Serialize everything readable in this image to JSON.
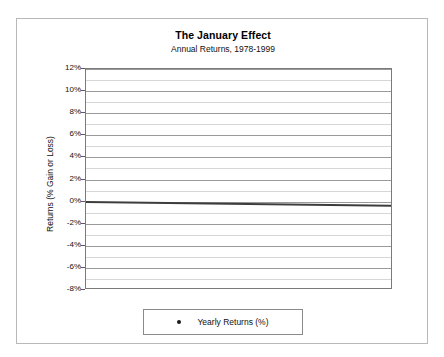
{
  "chart_data": {
    "type": "scatter",
    "title": "The January Effect",
    "subtitle": "Annual Returns, 1978-1999",
    "xlabel": "",
    "ylabel": "Returns (% Gain or Loss)",
    "xlim": [
      77.4,
      99.6
    ],
    "ylim": [
      -8,
      12
    ],
    "y_tick_step": 2,
    "x_tick_step": 2,
    "x_minor_step": 1,
    "grid": true,
    "legend_position": "bottom",
    "series": [
      {
        "name": "Yearly Returns (%)",
        "marker": "circle",
        "color": "#1a1a1a",
        "x": [
          1978,
          1979,
          1980,
          1981,
          1982,
          1983,
          1984,
          1985,
          1986,
          1987,
          1988,
          1989,
          1990,
          1991,
          1992,
          1993,
          1994,
          1995,
          1996,
          1997,
          1998,
          1999
        ],
        "values": [
          9.9,
          4.0,
          9.6,
          2.0,
          -0.05,
          2.45,
          -0.35,
          3.0,
          0.75,
          -2.25,
          1.15,
          -1.75,
          -0.85,
          4.0,
          6.6,
          2.3,
          0.2,
          -2.1,
          -1.85,
          -3.1,
          -2.15,
          -4.8
        ]
      }
    ],
    "trendline": {
      "name": "Linear trend",
      "color": "#3d3d3d",
      "y_start": 0.05,
      "y_end": -0.3
    },
    "x_tick_labels": [
      "78",
      "80",
      "82",
      "84",
      "86",
      "88",
      "90",
      "92",
      "94",
      "96",
      "98"
    ],
    "x_tick_values": [
      1978,
      1980,
      1982,
      1984,
      1986,
      1988,
      1990,
      1992,
      1994,
      1996,
      1998
    ],
    "y_tick_labels": [
      "12%",
      "10%",
      "8%",
      "6%",
      "4%",
      "2%",
      "0%",
      "-2%",
      "-4%",
      "-6%",
      "-8%"
    ],
    "y_tick_values": [
      12,
      10,
      8,
      6,
      4,
      2,
      0,
      -2,
      -4,
      -6,
      -8
    ]
  },
  "legend": {
    "entries": [
      {
        "label": "Yearly Returns (%)",
        "marker": "circle-marker",
        "color": "#1a1a1a"
      }
    ]
  }
}
